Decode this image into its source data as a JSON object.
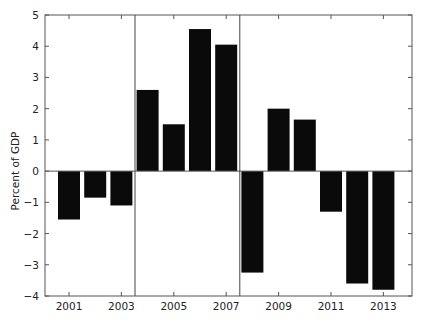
{
  "chart_data": {
    "type": "bar",
    "title": "",
    "xlabel": "",
    "ylabel": "Percent of GDP",
    "ylim": [
      -4,
      5
    ],
    "yticks": [
      -4,
      -3,
      -2,
      -1,
      0,
      1,
      2,
      3,
      4,
      5
    ],
    "xtick_labels": [
      "2001",
      "2003",
      "2005",
      "2007",
      "2009",
      "2011",
      "2013"
    ],
    "categories": [
      "2001",
      "2002",
      "2003",
      "2004",
      "2005",
      "2006",
      "2007",
      "2008",
      "2009",
      "2010",
      "2011",
      "2012",
      "2013"
    ],
    "values": [
      -1.55,
      -0.85,
      -1.1,
      2.6,
      1.5,
      4.55,
      4.05,
      -3.25,
      2.0,
      1.65,
      -1.3,
      -3.6,
      -3.8
    ],
    "vertical_separators_between": [
      [
        "2003",
        "2004"
      ],
      [
        "2007",
        "2008"
      ]
    ],
    "grid": false,
    "legend": null,
    "bar_color": "#0a0a0a"
  }
}
